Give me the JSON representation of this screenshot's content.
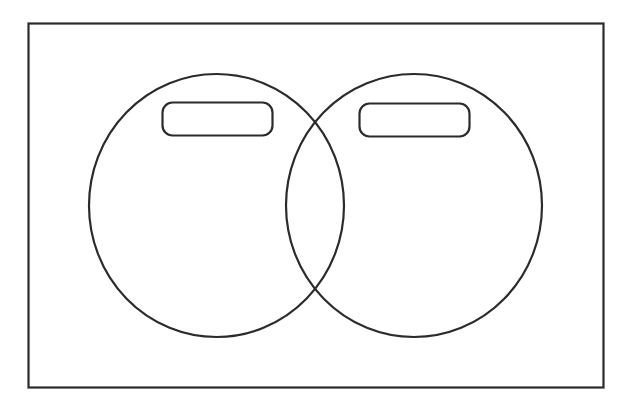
{
  "diagram": {
    "type": "venn",
    "stroke_color": "#2b2b2b",
    "background_color": "#ffffff",
    "universe": {
      "label": ""
    },
    "sets": [
      {
        "id": "A",
        "label": ""
      },
      {
        "id": "B",
        "label": ""
      }
    ],
    "intersection": {
      "label": ""
    }
  }
}
